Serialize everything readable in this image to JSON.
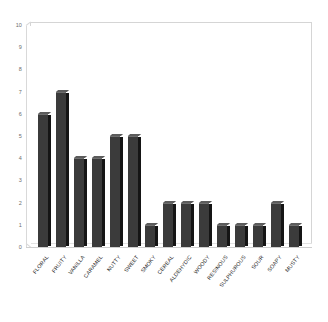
{
  "chart_data": {
    "type": "bar",
    "title": "",
    "subtitle": "",
    "xlabel": "",
    "ylabel": "",
    "ylim": [
      0,
      10
    ],
    "grid": false,
    "legend": false,
    "legend_position": "none",
    "y_ticks": [
      "10",
      "9",
      "8",
      "7",
      "6",
      "5",
      "4",
      "3",
      "2",
      "1",
      "0"
    ],
    "categories": [
      "FLORAL",
      "FRUITY",
      "VANILLA",
      "CARAMEL",
      "NUTTY",
      "SWEET",
      "SMOKY",
      "CEREAL",
      "ALDEHYDIC",
      "WOODY",
      "RESINOUS",
      "SULPHUROUS",
      "SOUR",
      "SOAPY",
      "MUSTY"
    ],
    "values": [
      6,
      7,
      4,
      4,
      5,
      5,
      1,
      2,
      2,
      2,
      1,
      1,
      1,
      2,
      1
    ],
    "colors": {
      "bar_face": "#3b3b3b",
      "bar_side": "#151515",
      "bar_top": "#5c5c5c",
      "axis_line": "#d5d5d5",
      "tick_text": "#6d6d6d",
      "label_text": "#2b2b2b",
      "background": "#ffffff"
    }
  }
}
